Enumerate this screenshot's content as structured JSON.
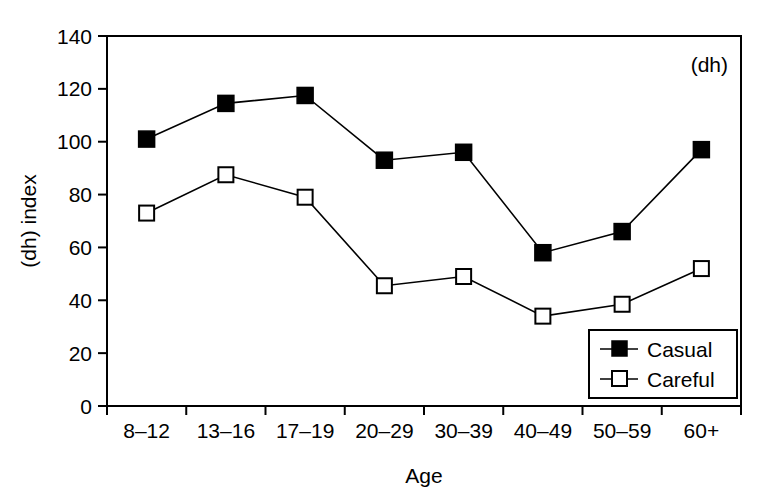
{
  "chart_data": {
    "type": "line",
    "title": "",
    "subtitle": "",
    "xlabel": "Age",
    "ylabel": "(dh) index",
    "annotation": "(dh)",
    "categories": [
      "8–12",
      "13–16",
      "17–19",
      "20–29",
      "30–39",
      "40–49",
      "50–59",
      "60+"
    ],
    "series": [
      {
        "name": "Casual",
        "marker": "filled-square",
        "color": "#000000",
        "values": [
          101,
          114.5,
          117.5,
          93,
          96,
          58,
          66,
          97
        ]
      },
      {
        "name": "Careful",
        "marker": "open-square",
        "color": "#000000",
        "values": [
          73,
          87.5,
          79,
          45.5,
          49,
          34,
          38.5,
          52
        ]
      }
    ],
    "ylim": [
      0,
      140
    ],
    "yticks": [
      0,
      20,
      40,
      60,
      80,
      100,
      120,
      140
    ],
    "ytick_labels": [
      "0",
      "20",
      "40",
      "60",
      "80",
      "100",
      "120",
      "140"
    ],
    "grid": false,
    "legend_position": "bottom-right",
    "legend_entries": [
      "Casual",
      "Careful"
    ]
  }
}
